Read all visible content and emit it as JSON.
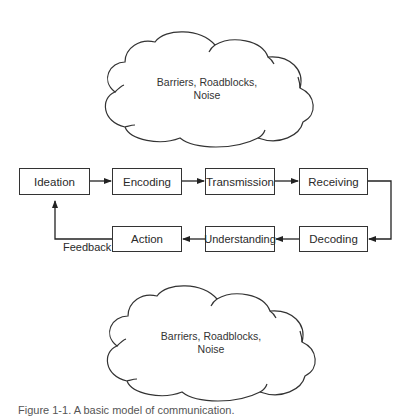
{
  "diagram": {
    "top_cloud": {
      "text_line1": "Barriers, Roadblocks,",
      "text_line2": "Noise"
    },
    "bottom_cloud": {
      "text_line1": "Barriers, Roadblocks,",
      "text_line2": "Noise"
    },
    "top_row": [
      {
        "label": "Ideation"
      },
      {
        "label": "Encoding"
      },
      {
        "label": "Transmission"
      },
      {
        "label": "Receiving"
      }
    ],
    "bottom_row": [
      {
        "label": "Action"
      },
      {
        "label": "Understanding"
      },
      {
        "label": "Decoding"
      }
    ],
    "feedback_label": "Feedback",
    "caption": "Figure 1-1. A basic model of communication."
  }
}
